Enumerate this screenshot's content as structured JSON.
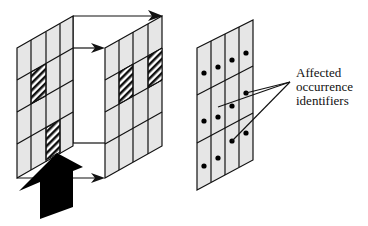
{
  "diagram": {
    "type": "schematic",
    "colors": {
      "cell_fill": "#e6e6e6",
      "line": "#111111",
      "background": "#ffffff",
      "arrow_fill": "#000000"
    },
    "left_panel": {
      "rows": 4,
      "cols": 4,
      "hatched_cells": [
        [
          1,
          1
        ],
        [
          3,
          2
        ]
      ]
    },
    "right_panel": {
      "rows": 4,
      "cols": 4,
      "hatched_cells": [
        [
          1,
          1
        ],
        [
          1,
          3
        ]
      ]
    },
    "dot_grid": {
      "rows": 3,
      "cols": 4,
      "dots_per_cell": 1
    },
    "label": {
      "line1": "Affected",
      "line2": "occurrence",
      "line3": "identifiers"
    }
  }
}
